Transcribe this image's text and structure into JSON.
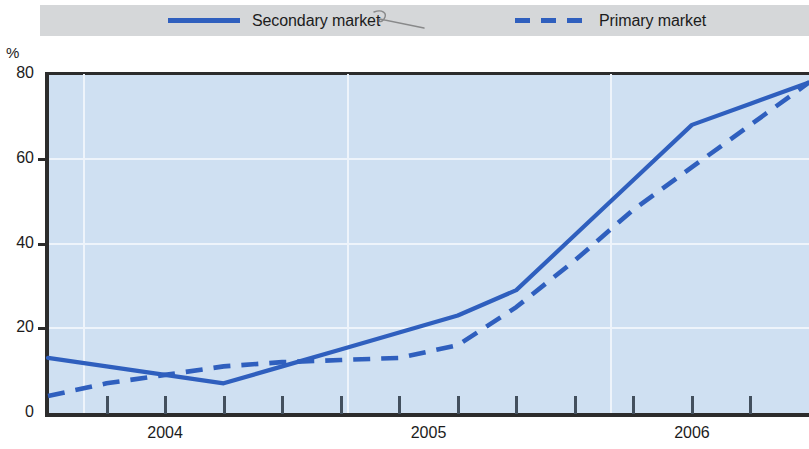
{
  "legend": {
    "background_color": "#d5d7d9",
    "entries": [
      {
        "label": "Secondary market",
        "style": "solid",
        "color": "#2f5fbe",
        "icon": "solid-line-swatch-icon"
      },
      {
        "label": "Primary market",
        "style": "dashed",
        "color": "#2f5fbe",
        "icon": "dashed-line-swatch-icon"
      }
    ],
    "artifact": "pencil-check-mark"
  },
  "axes": {
    "y_unit": "%",
    "y_ticks": [
      "0",
      "20",
      "40",
      "60",
      "80"
    ],
    "x_ticks": [
      "2004",
      "2005",
      "2006"
    ]
  },
  "chart_data": {
    "type": "line",
    "title": "",
    "subtitle": "",
    "xlabel": "",
    "ylabel": "%",
    "ylim": [
      0,
      80
    ],
    "yticks": [
      0,
      20,
      40,
      60,
      80
    ],
    "grid": true,
    "legend_position": "top",
    "x_tick_labels": [
      "2004",
      "2005",
      "2006"
    ],
    "x_minor_tick_count": 13,
    "x": [
      0,
      1,
      2,
      3,
      4,
      5,
      6,
      7,
      8,
      9,
      10,
      11,
      12,
      13
    ],
    "series": [
      {
        "name": "Secondary market",
        "style": "solid",
        "color": "#2f5fbe",
        "values": [
          13,
          11,
          9,
          7,
          11,
          15,
          19,
          23,
          29,
          42,
          55,
          68,
          73,
          78
        ]
      },
      {
        "name": "Primary market",
        "style": "dashed",
        "color": "#2f5fbe",
        "values": [
          4,
          7,
          9,
          11,
          12,
          12.5,
          13,
          16,
          25,
          36,
          48,
          58,
          68,
          78
        ]
      }
    ],
    "annotations": []
  }
}
